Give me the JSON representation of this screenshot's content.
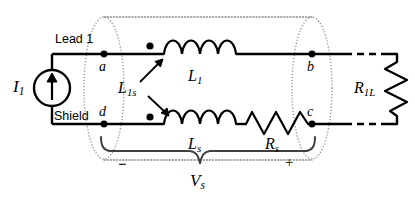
{
  "figure": {
    "type": "electrical-schematic",
    "background_color": "#ffffff",
    "line_color": "#000000",
    "shield_region_color": "#8c8c8c"
  },
  "labels": {
    "current_source": "I",
    "current_source_sub": "1",
    "lead1": "Lead 1",
    "shield": "Shield",
    "node_a": "a",
    "node_b": "b",
    "node_c": "c",
    "node_d": "d",
    "inductor_top": "L",
    "inductor_top_sub": "1",
    "inductor_bottom": "L",
    "inductor_bottom_sub": "s",
    "mutual": "L",
    "mutual_sub": "1s",
    "resistor_series": "R",
    "resistor_series_sub": "s",
    "resistor_load": "R",
    "resistor_load_sub": "1L",
    "voltage": "V",
    "voltage_sub": "s",
    "polarity_minus": "−",
    "polarity_plus": "+"
  },
  "components": [
    {
      "id": "I1",
      "name": "current-source",
      "kind": "current-source",
      "label": "I₁",
      "terminals": [
        "lead1-top",
        "shield-bottom"
      ]
    },
    {
      "id": "L1",
      "name": "inductor-lead",
      "kind": "inductor",
      "label": "L₁",
      "turns": 4,
      "branch": "top"
    },
    {
      "id": "Ls",
      "name": "inductor-shield",
      "kind": "inductor",
      "label": "Lₛ",
      "turns": 4,
      "branch": "bottom"
    },
    {
      "id": "Rs",
      "name": "resistor-shield",
      "kind": "resistor",
      "label": "Rₛ",
      "zigzags": 4,
      "branch": "bottom"
    },
    {
      "id": "R1L",
      "name": "resistor-load",
      "kind": "resistor",
      "label": "R₁ₗ",
      "zigzags": 4,
      "branch": "right",
      "orientation": "vertical"
    },
    {
      "id": "L1s",
      "name": "mutual-inductance",
      "kind": "mutual-coupling",
      "label": "L₁ₛ",
      "couples": [
        "L1",
        "Ls"
      ]
    }
  ],
  "nodes": [
    {
      "id": "a",
      "label": "a",
      "x": 104,
      "y": 54
    },
    {
      "id": "b",
      "label": "b",
      "x": 312,
      "y": 54
    },
    {
      "id": "c",
      "label": "c",
      "x": 312,
      "y": 124
    },
    {
      "id": "d",
      "label": "d",
      "x": 104,
      "y": 124
    }
  ],
  "dots": [
    {
      "name": "node-dot-a",
      "x": 104,
      "y": 54
    },
    {
      "name": "polarity-dot-top",
      "x": 150,
      "y": 47
    },
    {
      "name": "node-dot-b",
      "x": 312,
      "y": 54
    },
    {
      "name": "node-dot-d",
      "x": 104,
      "y": 124
    },
    {
      "name": "polarity-dot-bottom",
      "x": 150,
      "y": 119
    },
    {
      "name": "node-dot-c",
      "x": 312,
      "y": 124
    }
  ],
  "annotations": {
    "shield_ellipses": [
      "left-ellipse-ad",
      "right-ellipse-bc"
    ],
    "shield_tube": "dotted-tube-outline",
    "brace": {
      "label": "Vₛ",
      "left_sign": "−",
      "right_sign": "+",
      "spans": [
        "Ls",
        "Rs"
      ]
    }
  }
}
